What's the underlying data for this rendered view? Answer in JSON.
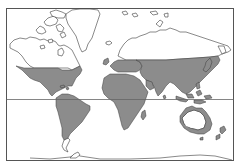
{
  "map": {
    "title": "",
    "projection": "world map",
    "colors": {
      "background": "#ffffff",
      "shaded_region": "#8c8c8c",
      "outline": "#3a3a3a",
      "frame": "#555555",
      "equator": "#666666"
    },
    "layers": [
      {
        "name": "frame",
        "description": "rectangular map border"
      },
      {
        "name": "equator",
        "description": "horizontal equator line"
      },
      {
        "name": "shaded-regions",
        "description": "gray-filled land areas (temperate and tropical zones)"
      },
      {
        "name": "unshaded-land",
        "description": "white land outlines (Arctic Canada, Greenland, northern Eurasia, southern South America, Antarctica)"
      }
    ],
    "shaded_regions": [
      "North America (USA, Mexico, Central America)",
      "South America (excluding southern tip)",
      "Europe (southern/central)",
      "Africa",
      "Asia (south of Siberia)",
      "Southeast Asia & Indonesia",
      "Japan",
      "Madagascar",
      "Australia (eastern & northern coastal)",
      "New Zealand"
    ],
    "unshaded_regions": [
      "Canada & Arctic Archipelago",
      "Greenland",
      "Iceland",
      "Scandinavia (north)",
      "Siberia / northern Russia",
      "Patagonia",
      "Australia interior",
      "Antarctica"
    ]
  }
}
